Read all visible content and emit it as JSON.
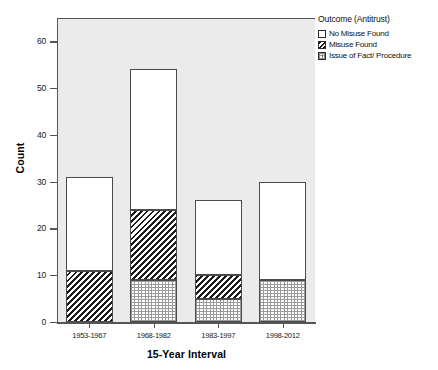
{
  "chart_data": {
    "type": "bar",
    "subtype": "stacked",
    "title": "",
    "xlabel": "15-Year Interval",
    "ylabel": "Count",
    "categories": [
      "1953-1967",
      "1968-1982",
      "1983-1997",
      "1998-2012"
    ],
    "ylim": [
      0,
      65
    ],
    "yticks": [
      0,
      10,
      20,
      30,
      40,
      50,
      60
    ],
    "ytick_labels": [
      "0",
      "10",
      "20",
      "30",
      "40",
      "50",
      "60"
    ],
    "grid": false,
    "legend_position": "right",
    "legend_title": "Outcome (Antitrust)",
    "series": [
      {
        "name": "Issue of Fact/ Procedure",
        "pattern": "dotted",
        "values": [
          0,
          9,
          5,
          9
        ]
      },
      {
        "name": "Misuse Found",
        "pattern": "diagonal-hatch",
        "values": [
          11,
          15,
          5,
          0
        ]
      },
      {
        "name": "No Misuse Found",
        "pattern": "solid-white",
        "values": [
          20,
          30,
          16,
          21
        ]
      }
    ],
    "totals": [
      31,
      54,
      26,
      30
    ]
  },
  "legend": {
    "title": "Outcome (Antitrust)",
    "items": [
      {
        "label": "No Misuse Found",
        "pattern": "no-misuse"
      },
      {
        "label": "Misuse Found",
        "pattern": "misuse"
      },
      {
        "label": "Issue of Fact/ Procedure",
        "pattern": "issue"
      }
    ]
  },
  "axes": {
    "y_title": "Count",
    "x_title": "15-Year Interval"
  },
  "colors": {
    "plot_background": "#ebebeb",
    "axis_line": "#555555",
    "bar_outline": "#4a4a4a",
    "hatch": "#1c1c1c",
    "dot": "#9a9a9a",
    "page_background": "#ffffff"
  }
}
